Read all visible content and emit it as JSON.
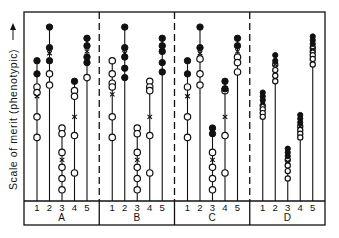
{
  "chart_data": {
    "type": "scatter",
    "title": "",
    "ylabel": "Scale of merit (phenotypic)",
    "xlabel": "",
    "groups": [
      "A",
      "B",
      "C",
      "D"
    ],
    "categories": [
      "1",
      "2",
      "3",
      "4",
      "5"
    ],
    "legend": [
      {
        "marker": "filled-circle",
        "meaning": "selected/high individuals"
      },
      {
        "marker": "open-circle",
        "meaning": "other individuals"
      },
      {
        "marker": "x",
        "meaning": "mean"
      }
    ],
    "y_scale": "relative merit, 0 (bottom) to 100 (top)",
    "series": [
      {
        "group": "A",
        "family": "1",
        "filled": [
          75,
          68
        ],
        "open": [
          61,
          58,
          45,
          34
        ],
        "mean": 56,
        "stem_base": 0
      },
      {
        "group": "A",
        "family": "2",
        "filled": [
          93,
          82,
          75
        ],
        "open": [
          68,
          62
        ],
        "mean": 79
      },
      {
        "group": "A",
        "family": "3",
        "filled": [],
        "open": [
          39,
          36,
          26,
          18,
          12,
          6
        ],
        "mean": 22
      },
      {
        "group": "A",
        "family": "4",
        "filled": [
          64
        ],
        "open": [
          59,
          56,
          35,
          15
        ],
        "mean": 45
      },
      {
        "group": "A",
        "family": "5",
        "filled": [
          87,
          83,
          77,
          74
        ],
        "open": [
          66
        ],
        "mean": 80
      },
      {
        "group": "B",
        "family": "1",
        "filled": [],
        "open": [
          75,
          68,
          63,
          61,
          45,
          34
        ],
        "mean": 57
      },
      {
        "group": "B",
        "family": "2",
        "filled": [
          93,
          82,
          77,
          71,
          66
        ],
        "open": [],
        "mean": 79
      },
      {
        "group": "B",
        "family": "3",
        "filled": [],
        "open": [
          39,
          36,
          26,
          18,
          12,
          6
        ],
        "mean": 22
      },
      {
        "group": "B",
        "family": "4",
        "filled": [],
        "open": [
          64,
          61,
          59,
          35,
          15
        ],
        "mean": 45
      },
      {
        "group": "B",
        "family": "5",
        "filled": [
          87,
          83,
          80,
          74,
          69
        ],
        "open": [],
        "mean": 80
      },
      {
        "group": "C",
        "family": "1",
        "filled": [
          75,
          68
        ],
        "open": [
          61,
          45,
          34
        ],
        "mean": 56
      },
      {
        "group": "C",
        "family": "2",
        "filled": [
          93,
          82
        ],
        "open": [
          76,
          68,
          62
        ],
        "mean": 79
      },
      {
        "group": "C",
        "family": "3",
        "filled": [
          39,
          36
        ],
        "open": [
          26,
          18,
          12,
          6
        ],
        "mean": 22
      },
      {
        "group": "C",
        "family": "4",
        "filled": [
          64,
          60
        ],
        "open": [
          59,
          35,
          15
        ],
        "mean": 45
      },
      {
        "group": "C",
        "family": "5",
        "filled": [
          87,
          83
        ],
        "open": [
          77,
          74,
          69
        ],
        "mean": 80
      },
      {
        "group": "D",
        "family": "1",
        "filled": [
          58,
          56,
          54
        ],
        "open": [
          51,
          49,
          47,
          45
        ],
        "mean": 52
      },
      {
        "group": "D",
        "family": "2",
        "filled": [
          78,
          75
        ],
        "open": [
          73,
          70,
          67,
          64
        ],
        "mean": 73
      },
      {
        "group": "D",
        "family": "3",
        "filled": [
          28,
          26,
          24
        ],
        "open": [
          22,
          19,
          16,
          12
        ],
        "mean": 21
      },
      {
        "group": "D",
        "family": "4",
        "filled": [
          46,
          44,
          42
        ],
        "open": [
          40,
          38,
          36,
          34
        ],
        "mean": 40
      },
      {
        "group": "D",
        "family": "5",
        "filled": [
          88,
          86,
          84
        ],
        "open": [
          82,
          80,
          78,
          76,
          73
        ],
        "mean": 81
      }
    ],
    "grid": false,
    "legend_position": "none"
  }
}
